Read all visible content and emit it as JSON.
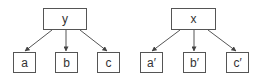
{
  "trees": [
    {
      "root": {
        "label": "y"
      },
      "children": [
        {
          "label": "a"
        },
        {
          "label": "b"
        },
        {
          "label": "c"
        }
      ]
    },
    {
      "root": {
        "label": "x"
      },
      "children": [
        {
          "label": "a′"
        },
        {
          "label": "b′"
        },
        {
          "label": "c′"
        }
      ]
    }
  ],
  "colors": {
    "stroke": "#555555",
    "text": "#333333",
    "background": "#ffffff"
  }
}
